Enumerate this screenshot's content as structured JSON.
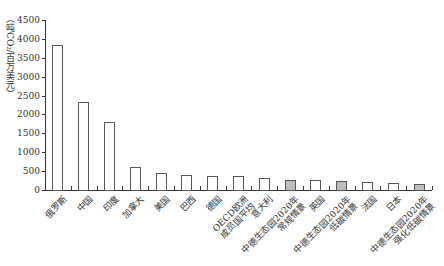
{
  "chart_data": {
    "type": "bar",
    "title": "",
    "xlabel": "",
    "ylabel": "（吨CO₂/百万美元）",
    "ylim": [
      0,
      4500
    ],
    "yticks": [
      0,
      500,
      1000,
      1500,
      2000,
      2500,
      3000,
      3500,
      4000,
      4500
    ],
    "grid": false,
    "legend": null,
    "categories": [
      "俄罗斯",
      "中国",
      "印度",
      "加拿大",
      "美国",
      "巴西",
      "德国",
      "OECD欧洲\n成员国平均",
      "意大利",
      "中德生态园2020年\n常规情景",
      "英国",
      "中德生态园2020年\n低碳情景",
      "法国",
      "日本",
      "中德生态园2020年\n强化低碳情景"
    ],
    "values": [
      3850,
      2320,
      1790,
      600,
      455,
      385,
      360,
      360,
      320,
      275,
      265,
      240,
      210,
      185,
      150
    ],
    "highlighted": [
      false,
      false,
      false,
      false,
      false,
      false,
      false,
      false,
      false,
      true,
      false,
      true,
      false,
      false,
      true
    ],
    "colors": {
      "default_fill": "#ffffff",
      "highlight_fill": "#bdbdbd",
      "border": "#555555",
      "axis": "#333333"
    }
  }
}
